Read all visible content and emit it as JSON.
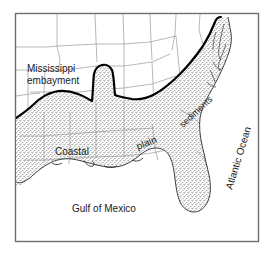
{
  "figure": {
    "type": "map",
    "background_color": "#ffffff",
    "frame_color": "#6e6e6e",
    "boundary_color": "#000000",
    "state_line_color": "#8c8c8c",
    "stipple_color": "#555555",
    "text_color": "#1a1a1a"
  },
  "labels": {
    "mississippi_embayment_line1": "Mississippi",
    "mississippi_embayment_line2": "embayment",
    "coastal": "Coastal",
    "plain": "plain",
    "sediments": "sediments",
    "atlantic_ocean": "Atlantic Ocean",
    "gulf_of_mexico": "Gulf of Mexico"
  },
  "regions": [
    {
      "name": "coastal-plain",
      "fill": "stipple",
      "description": "Stippled coastal plain sediments"
    },
    {
      "name": "mississippi-embayment",
      "fill": "stipple",
      "description": "Northward finger of coastal plain along the Mississippi valley"
    },
    {
      "name": "florida-peninsula",
      "fill": "stipple",
      "description": "Florida peninsula"
    },
    {
      "name": "gulf-of-mexico",
      "fill": "white",
      "description": "Open water of the Gulf of Mexico"
    },
    {
      "name": "atlantic-ocean",
      "fill": "white",
      "description": "Open water of the Atlantic Ocean"
    },
    {
      "name": "interior-uplands",
      "fill": "white",
      "description": "Inland states above the fall line"
    }
  ]
}
